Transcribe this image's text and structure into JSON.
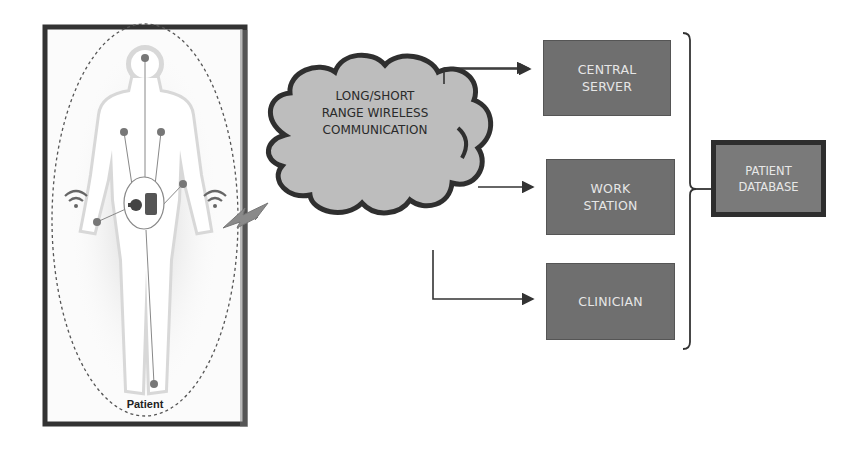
{
  "diagram": {
    "patient_panel": {
      "label": "Patient",
      "icons": [
        "wifi-icon-left",
        "wifi-icon-right",
        "body-sensor-hub",
        "lightning-link"
      ]
    },
    "cloud": {
      "label": "LONG/SHORT\nRANGE WIRELESS\nCOMMUNICATION"
    },
    "nodes": [
      {
        "id": "central_server",
        "label": "CENTRAL\nSERVER"
      },
      {
        "id": "work_station",
        "label": "WORK\nSTATION"
      },
      {
        "id": "clinician",
        "label": "CLINICIAN"
      }
    ],
    "database": {
      "label": "PATIENT\nDATABASE"
    },
    "colors": {
      "node_fill": "#6f6f6f",
      "node_text": "#e6e6e6",
      "cloud_fill": "#bdbdbd",
      "cloud_stroke": "#2f2f2f",
      "panel_border": "#333333"
    }
  }
}
